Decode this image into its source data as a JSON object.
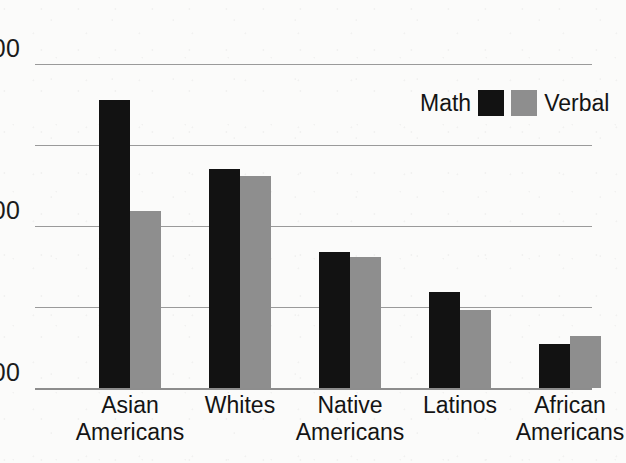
{
  "chart_data": {
    "type": "bar",
    "title": "",
    "subtitle": "",
    "xlabel": "",
    "ylabel": "",
    "ylim": [
      400,
      600
    ],
    "yticks": [
      400,
      450,
      500,
      550,
      600
    ],
    "ytick_labels": [
      "400",
      "",
      "500",
      "",
      "600"
    ],
    "grid": true,
    "legend_position": "top-right",
    "categories": [
      "Asian\nAmericans",
      "Whites",
      "Native\nAmericans",
      "Latinos",
      "African\nAmericans"
    ],
    "series": [
      {
        "name": "Math",
        "color": "#121212",
        "values": [
          578,
          535,
          484,
          459,
          427
        ]
      },
      {
        "name": "Verbal",
        "color": "#8e8e8e",
        "values": [
          509,
          531,
          481,
          448,
          432
        ]
      }
    ]
  },
  "legend": {
    "math_label": "Math",
    "verbal_label": "Verbal"
  },
  "colors": {
    "math": "#121212",
    "verbal": "#8e8e8e",
    "gridline": "#9a9a9a",
    "axis": "#8d8d8d",
    "text": "#141414",
    "background": "#fbfbfa"
  }
}
